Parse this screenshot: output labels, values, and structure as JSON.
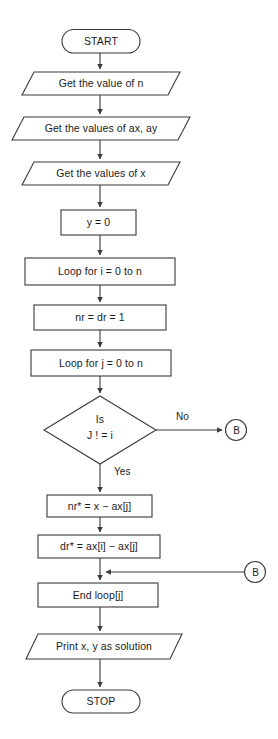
{
  "diagram": {
    "type": "flowchart",
    "stroke_color": "#3a3a3a",
    "fill_color": "#ffffff",
    "text_color": "#1b1b1b",
    "canvas": {
      "width": 278,
      "height": 739
    }
  },
  "nodes": {
    "start": {
      "label": "START",
      "shape": "terminator"
    },
    "get_n": {
      "label": "Get the value of n",
      "shape": "parallelogram"
    },
    "get_ax_ay": {
      "label": "Get the values of ax, ay",
      "shape": "parallelogram"
    },
    "get_x": {
      "label": "Get the values of x",
      "shape": "parallelogram"
    },
    "y_init": {
      "label": "y = 0",
      "shape": "process"
    },
    "loop_i": {
      "label": "Loop for i = 0 to n",
      "shape": "process"
    },
    "nr_dr_init": {
      "label": "nr = dr = 1",
      "shape": "process"
    },
    "loop_j": {
      "label": "Loop for j = 0 to n",
      "shape": "process"
    },
    "decision": {
      "label_line1": "Is",
      "label_line2": "J ! = i",
      "shape": "decision"
    },
    "nr_update": {
      "label": "nr* = x − ax[j]",
      "shape": "process"
    },
    "dr_update": {
      "label": "dr* = ax[i] − ax[j]",
      "shape": "process"
    },
    "end_loop_j": {
      "label": "End loop[j]",
      "shape": "process"
    },
    "print": {
      "label": "Print x, y as solution",
      "shape": "parallelogram"
    },
    "stop": {
      "label": "STOP",
      "shape": "terminator"
    },
    "connector_b_right": {
      "label": "B",
      "shape": "connector"
    },
    "connector_b_bottom": {
      "label": "B",
      "shape": "connector"
    }
  },
  "edge_labels": {
    "no": "No",
    "yes": "Yes"
  }
}
